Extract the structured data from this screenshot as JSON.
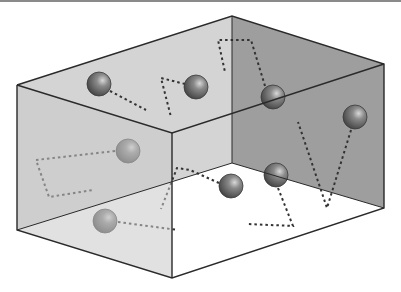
{
  "diagram": {
    "colors": {
      "back_left_wall": "#d2d2d2",
      "back_right_wall": "#9c9c9c",
      "front_face": "#c6c6c6",
      "floor": "#ffffff",
      "edge": "#2a2a2a",
      "path": "#333333",
      "ball": "#6a6a6a"
    },
    "molecules": [
      {
        "id": "m1",
        "cx": 99,
        "cy": 84
      },
      {
        "id": "m2",
        "cx": 196,
        "cy": 87
      },
      {
        "id": "m3",
        "cx": 273,
        "cy": 97
      },
      {
        "id": "m4",
        "cx": 355,
        "cy": 117
      },
      {
        "id": "m5",
        "cx": 128,
        "cy": 151
      },
      {
        "id": "m6",
        "cx": 231,
        "cy": 186
      },
      {
        "id": "m7",
        "cx": 276,
        "cy": 175
      },
      {
        "id": "m8",
        "cx": 105,
        "cy": 221
      }
    ],
    "paths": [
      {
        "id": "p1",
        "points": "110,91 146,110"
      },
      {
        "id": "p2",
        "points": "185,84 161,78 171,117"
      },
      {
        "id": "p3",
        "points": "265,86 251,40 218,40 225,72"
      },
      {
        "id": "p4",
        "points": "351,130 327,208 298,122"
      },
      {
        "id": "p5",
        "points": "115,151 36,160 49,197 93,190"
      },
      {
        "id": "p6",
        "points": "219,183 190,170 177,168 161,209"
      },
      {
        "id": "p7",
        "points": "278,188 293,226 248,224"
      },
      {
        "id": "p8",
        "points": "118,222 178,230"
      }
    ]
  }
}
